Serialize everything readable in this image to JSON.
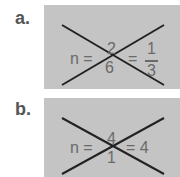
{
  "problems": [
    {
      "label": "a.",
      "lhs": "n =",
      "num": "2",
      "den": "6",
      "eq": "=",
      "rnum": "1",
      "rden": "3"
    },
    {
      "label": "b.",
      "lhs": "n =",
      "num": "4",
      "den": "1",
      "eq": "= 4"
    }
  ]
}
